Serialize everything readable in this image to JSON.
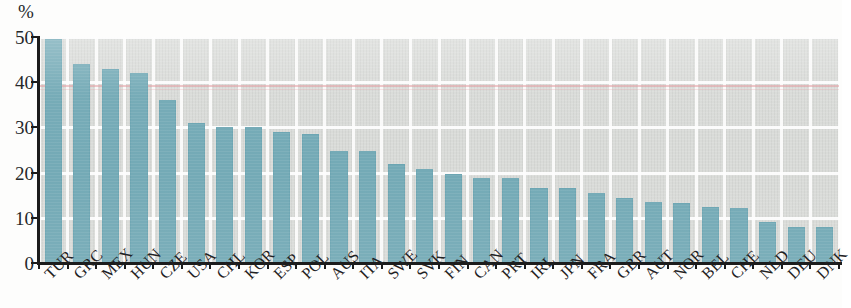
{
  "chart_data": {
    "type": "bar",
    "title": "",
    "subtitle": "",
    "xlabel": "",
    "ylabel": "",
    "unit_label": "%",
    "ylim": [
      0,
      50
    ],
    "yticks": [
      0,
      10,
      20,
      30,
      40,
      50
    ],
    "ytick_labels": [
      "0",
      "10",
      "20",
      "30",
      "40",
      "50"
    ],
    "grid": true,
    "grid_orientation": "both",
    "legend": false,
    "bar_color": "#74aab6",
    "plot_background_color": "#d9dbd8",
    "gridline_color": "#fdfdfd",
    "axis_color": "#1c1c1c",
    "categories": [
      "TUR",
      "GRC",
      "MEX",
      "HUN",
      "CZE",
      "USA",
      "CHL",
      "KOR",
      "ESP",
      "POL",
      "AUS",
      "ITA",
      "SWE",
      "SVK",
      "FIN",
      "CAN",
      "PRT",
      "IRL",
      "JPN",
      "FRA",
      "GBR",
      "AUT",
      "NOR",
      "BEL",
      "CHE",
      "NLD",
      "DEU",
      "DNK"
    ],
    "values": [
      49.5,
      44.0,
      43.0,
      42.0,
      36.0,
      31.0,
      30.0,
      30.0,
      29.0,
      28.5,
      24.8,
      24.8,
      21.8,
      20.8,
      19.8,
      18.8,
      18.7,
      16.7,
      16.7,
      15.5,
      14.3,
      13.5,
      13.3,
      12.3,
      12.2,
      9.0,
      8.0,
      8.0
    ]
  }
}
